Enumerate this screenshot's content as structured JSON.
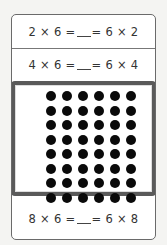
{
  "equations": [
    {
      "left": "2 × 6 =",
      "right": "= 6 × 2"
    },
    {
      "left": "4 × 6 =",
      "right": "= 6 × 4"
    },
    {
      "left": "8 × 6 =",
      "right": "= 6 × 8"
    }
  ],
  "dot_array": {
    "rows": 8,
    "columns": 6,
    "dot_color": "#0a0a0a",
    "border_color": "#5a5a5a"
  }
}
